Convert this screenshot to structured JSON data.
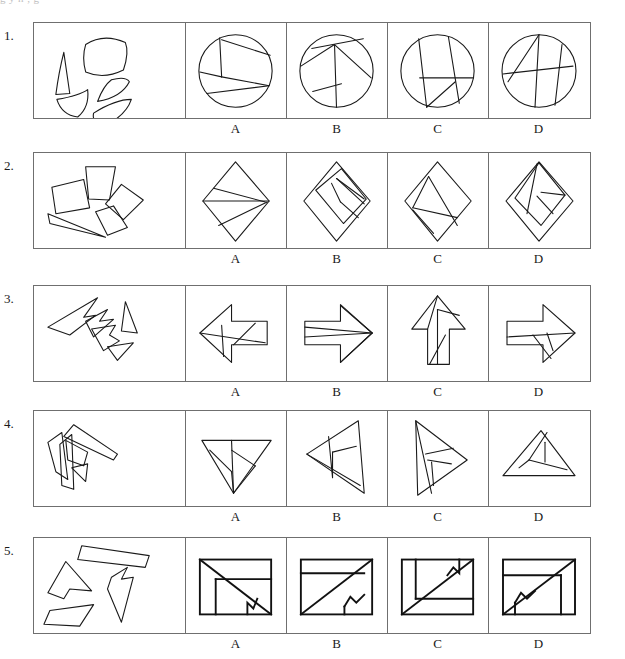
{
  "page": {
    "top_partial_text": "g                          y                          n        ,        g",
    "option_letters": [
      "A",
      "B",
      "C",
      "D"
    ],
    "stroke_color": "#1a1a1a",
    "background_color": "#ffffff",
    "border_color": "#6f6f6f"
  },
  "rows": [
    {
      "number": "1.",
      "prompt_description": "five curved puzzle pieces scattered",
      "assembled_shape": "circle",
      "options": [
        {
          "letter": "A",
          "description": "circle divided by chords into five regions"
        },
        {
          "letter": "B",
          "description": "circle divided by chords radiating from center-top"
        },
        {
          "letter": "C",
          "description": "circle with two steep parallel chords and a horizontal chord"
        },
        {
          "letter": "D",
          "description": "circle with crossing chords forming an X pattern"
        }
      ]
    },
    {
      "number": "2.",
      "prompt_description": "four quadrilaterals and one thin sliver",
      "assembled_shape": "rhombus",
      "options": [
        {
          "letter": "A",
          "description": "rhombus with horizontal split and triangular subdivisions"
        },
        {
          "letter": "B",
          "description": "rhombus containing an inner square split into pieces"
        },
        {
          "letter": "C",
          "description": "rhombus with inner triangle and thin sliver near bottom"
        },
        {
          "letter": "D",
          "description": "rhombus with inner square and diagonal pieces"
        }
      ]
    },
    {
      "number": "3.",
      "prompt_description": "four angular arrow-like fragments",
      "assembled_shape": "block arrow",
      "options": [
        {
          "letter": "A",
          "description": "left-pointing block arrow with internal cuts"
        },
        {
          "letter": "B",
          "description": "right-pointing block arrow with thin sliver across shaft"
        },
        {
          "letter": "C",
          "description": "up-pointing block arrow with internal cuts"
        },
        {
          "letter": "D",
          "description": "right-pointing block arrow with internal cuts"
        }
      ]
    },
    {
      "number": "4.",
      "prompt_description": "four elongated triangular and quadrilateral slivers",
      "assembled_shape": "triangle",
      "options": [
        {
          "letter": "A",
          "description": "downward triangle with flat top divided into pieces"
        },
        {
          "letter": "B",
          "description": "left-pointing triangle divided into pieces"
        },
        {
          "letter": "C",
          "description": "right-pointing triangle divided into pieces"
        },
        {
          "letter": "D",
          "description": "upward triangle divided into pieces"
        }
      ]
    },
    {
      "number": "5.",
      "prompt_description": "four polygons including a notched arrow-like shape",
      "assembled_shape": "rectangle",
      "options": [
        {
          "letter": "A",
          "description": "rectangle with diagonal and notched zigzag cut"
        },
        {
          "letter": "B",
          "description": "rectangle with long diagonal and notch at bottom right"
        },
        {
          "letter": "C",
          "description": "rectangle with diagonal and notched zigzag near top right"
        },
        {
          "letter": "D",
          "description": "rectangle with diagonal and notched zigzag at bottom left"
        }
      ]
    }
  ]
}
